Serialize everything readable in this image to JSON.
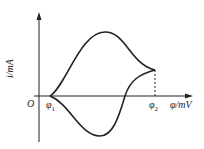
{
  "diagram": {
    "type": "cyclic-voltammogram",
    "axes": {
      "origin_label": "O",
      "y_label": "i/mA",
      "x_label": "φ/mV"
    },
    "markers": [
      {
        "id": "phi1",
        "label": "φ₁",
        "sub": "1"
      },
      {
        "id": "phi2",
        "label": "φ₂",
        "sub": "2"
      }
    ],
    "curves": [
      {
        "name": "anodic-sweep",
        "description": "Upper branch rising from φ1 to a peak then falling to the vertex at φ2"
      },
      {
        "name": "cathodic-sweep",
        "description": "Lower branch from the vertex at φ2 crossing the axis and dipping to a trough, returning to φ1"
      }
    ],
    "dashed_line": "vertical dashed line from the vertex down to φ2 on the x-axis",
    "colors": {
      "line": "#222222",
      "background": "#ffffff"
    }
  }
}
